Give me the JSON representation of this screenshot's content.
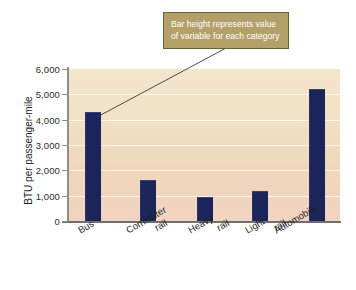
{
  "chart_data": {
    "type": "bar",
    "title": "",
    "subtitle": "",
    "xlabel": "",
    "ylabel": "BTU per passenger-mile",
    "categories": [
      "Bus",
      "Commuter rail",
      "Heavy rail",
      "Light rail",
      "Automobile"
    ],
    "category_lines": [
      [
        "Bus"
      ],
      [
        "Commuter",
        "rail"
      ],
      [
        "Heavy",
        "rail"
      ],
      [
        "Light",
        "rail"
      ],
      [
        "Automobile"
      ]
    ],
    "values": [
      4300,
      1600,
      950,
      1200,
      5200
    ],
    "ylim": [
      0,
      6000
    ],
    "ytick_values": [
      0,
      1000,
      2000,
      3000,
      4000,
      5000,
      6000
    ],
    "ytick_labels": [
      "0",
      "1,000",
      "2,000",
      "3,000",
      "4,000",
      "5,000",
      "6,000"
    ],
    "grid": true,
    "legend": null,
    "legend_position": "none",
    "annotations": [
      {
        "text": "Bar height represents value of variable for each category",
        "lines": [
          "Bar height represents value",
          "of variable for each category"
        ],
        "points_to": "Bus"
      }
    ],
    "colors": {
      "bar": "#1b2559",
      "plot_background_top": "#f3e6cd",
      "plot_background_bottom": "#f2d3c0",
      "gridline": "#ffffff",
      "axis": "#8e8e8e",
      "annotation_background": "#b3a069",
      "annotation_border": "#6e6034",
      "annotation_text": "#ffffff",
      "text": "#1f1f1f"
    }
  }
}
